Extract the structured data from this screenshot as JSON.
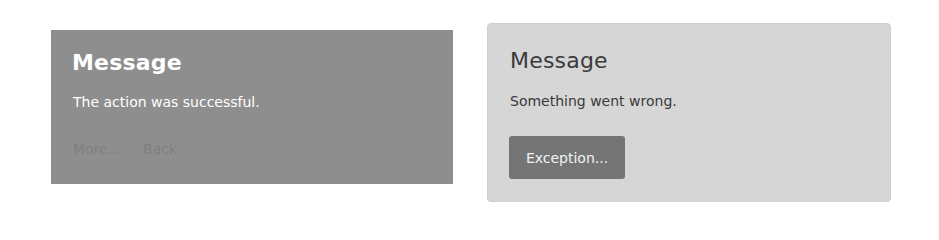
{
  "cards": {
    "success": {
      "title": "Message",
      "text": "The action was successful.",
      "links": [
        {
          "label": "More..."
        },
        {
          "label": "Back"
        }
      ],
      "background": "#8e8e8e"
    },
    "error": {
      "title": "Message",
      "text": "Something went wrong.",
      "button_label": "Exception...",
      "background": "#d6d6d6",
      "button_color": "#757575"
    }
  }
}
